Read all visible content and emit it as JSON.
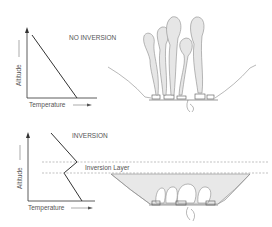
{
  "panels": [
    {
      "title": "NO INVERSION",
      "xlabel": "Temperature",
      "ylabel": "Altitude",
      "profile": "linear temperature decrease with altitude"
    },
    {
      "title": "INVERSION",
      "xlabel": "Temperature",
      "ylabel": "Altitude",
      "layer_label": "Inversion Layer",
      "profile": "temperature increases within inversion layer"
    }
  ],
  "colors": {
    "line": "#333333",
    "smoke_fill": "#e4e4e4",
    "smoke_stroke": "#8a8a8a",
    "dashed": "#999999"
  }
}
